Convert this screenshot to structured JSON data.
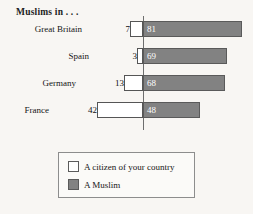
{
  "chart_data": {
    "type": "bar",
    "title": "Muslims in . . .",
    "subtitle": "",
    "xlabel": "",
    "ylabel": "",
    "orientation": "horizontal",
    "stacked": "diverging",
    "grid": false,
    "axis_center_value": 0,
    "categories": [
      "Great Britain",
      "Spain",
      "Germany",
      "France"
    ],
    "series": [
      {
        "name": "A citizen of your country",
        "color": "#ffffff",
        "direction": "left",
        "values": [
          7,
          3,
          13,
          42
        ]
      },
      {
        "name": "A Muslim",
        "color": "#828282",
        "direction": "right",
        "values": [
          81,
          69,
          68,
          48
        ]
      }
    ],
    "legend_position": "bottom",
    "legend_entries": [
      "A citizen of your country",
      "A Muslim"
    ]
  },
  "rows": [
    {
      "label": "Great Britain",
      "left_value": "7",
      "right_value": "81",
      "left_px": 13,
      "right_px": 99,
      "top": 5
    },
    {
      "label": "Spain",
      "left_value": "3",
      "right_value": "69",
      "left_px": 6,
      "right_px": 84,
      "top": 32
    },
    {
      "label": "Germany",
      "left_value": "13",
      "right_value": "68",
      "left_px": 19,
      "right_px": 82,
      "top": 59
    },
    {
      "label": "France",
      "left_value": "42",
      "right_value": "48",
      "left_px": 46,
      "right_px": 57,
      "top": 86
    }
  ],
  "legend": {
    "items": [
      {
        "label": "A citizen of your country",
        "swatch": "white-swatch"
      },
      {
        "label": "A Muslim",
        "swatch": "gray-swatch"
      }
    ]
  }
}
